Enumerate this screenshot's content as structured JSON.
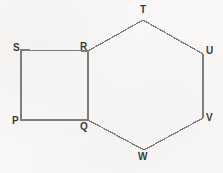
{
  "figure": {
    "background_color": "#f8f7f5",
    "stroke_color": "#7d7d7d",
    "label_color": "#3b3b3b",
    "shapes": [
      {
        "name": "square-pqrs",
        "type": "square",
        "vertices": [
          "P",
          "Q",
          "R",
          "S"
        ],
        "path": "21,120 88,120 88,51 21,50 21,120"
      },
      {
        "name": "hexagon-qrtuvw",
        "type": "hexagon",
        "vertices": [
          "Q",
          "R",
          "T",
          "U",
          "V",
          "W"
        ],
        "path": "88,120 88,51 143,20 203,54 203,118 144,150 88,120"
      }
    ],
    "shared_edge": "QR",
    "labels": [
      {
        "id": "S",
        "text": "S",
        "x": 13,
        "y": 43
      },
      {
        "id": "R",
        "text": "R",
        "x": 80,
        "y": 42
      },
      {
        "id": "T",
        "text": "T",
        "x": 140,
        "y": 5
      },
      {
        "id": "U",
        "text": "U",
        "x": 206,
        "y": 46
      },
      {
        "id": "P",
        "text": "P",
        "x": 12,
        "y": 116
      },
      {
        "id": "Q",
        "text": "Q",
        "x": 80,
        "y": 122
      },
      {
        "id": "V",
        "text": "V",
        "x": 206,
        "y": 113
      },
      {
        "id": "W",
        "text": "W",
        "x": 138,
        "y": 152
      }
    ]
  }
}
